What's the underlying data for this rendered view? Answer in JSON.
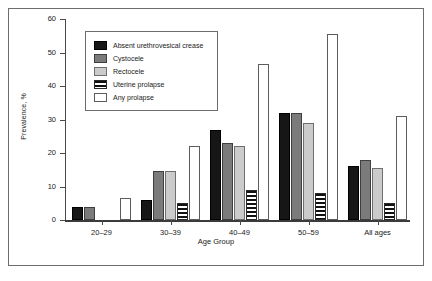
{
  "chart_data": {
    "type": "bar",
    "title": "",
    "xlabel": "Age Group",
    "ylabel": "Prevalence, %",
    "ylim": [
      0,
      60
    ],
    "yticks": [
      0,
      10,
      20,
      30,
      40,
      50,
      60
    ],
    "grid": false,
    "legend_position": "top-left-inside",
    "categories": [
      "20–29",
      "30–39",
      "40–49",
      "50–59",
      "All ages"
    ],
    "series": [
      {
        "name": "Absent urethrovesical crease",
        "color": "#161616",
        "values": [
          4,
          6,
          27,
          32,
          16
        ]
      },
      {
        "name": "Cystocele",
        "color": "#7b7b7b",
        "values": [
          4,
          14.5,
          23,
          32,
          18
        ]
      },
      {
        "name": "Rectocele",
        "color": "#cbcbcb",
        "values": [
          0,
          14.5,
          22,
          29,
          15.5
        ]
      },
      {
        "name": "Uterine prolapse",
        "color": "#111111",
        "values": [
          0,
          5,
          9,
          8,
          5
        ]
      },
      {
        "name": "Any prolapse",
        "color": "#ffffff",
        "values": [
          6.5,
          22,
          46.5,
          55.5,
          31
        ]
      }
    ]
  }
}
